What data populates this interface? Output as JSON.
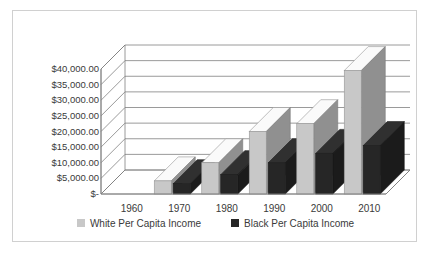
{
  "chart_data": {
    "type": "bar",
    "title": "",
    "subtitle": "",
    "xlabel": "",
    "ylabel": "",
    "categories": [
      "1960",
      "1970",
      "1980",
      "1990",
      "2000",
      "2010"
    ],
    "series": [
      {
        "name": "White Per Capita Income",
        "color": "#c8c8c8",
        "values": [
          0,
          4200,
          10000,
          20000,
          22500,
          39500
        ]
      },
      {
        "name": "Black Per Capita Income",
        "color": "#262626",
        "values": [
          0,
          3300,
          6200,
          10000,
          13000,
          15500
        ]
      }
    ],
    "ylim": [
      0,
      40000
    ],
    "ytick_values": [
      0,
      5000,
      10000,
      15000,
      20000,
      25000,
      30000,
      35000,
      40000
    ],
    "ytick_labels": [
      "$-",
      "$5,000.00",
      "$10,000.00",
      "$15,000.00",
      "$20,000.00",
      "$25,000.00",
      "$30,000.00",
      "$35,000.00",
      "$40,000.00"
    ],
    "grid": true,
    "legend_position": "bottom",
    "style": "3d-column",
    "plot_background": "#ffffff",
    "gridline_color": "#808080",
    "border_color": "#d0d0d0"
  }
}
